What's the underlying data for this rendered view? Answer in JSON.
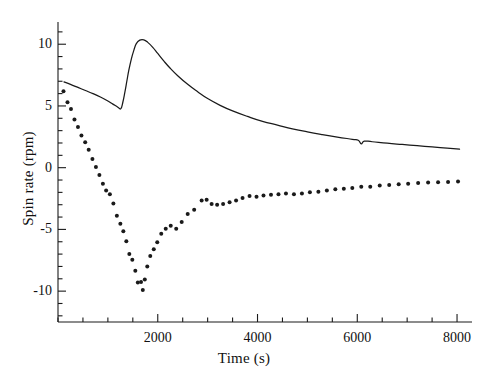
{
  "chart_data": {
    "type": "line",
    "title": "",
    "xlabel": "Time (s)",
    "ylabel": "Spin rate (rpm)",
    "xlim": [
      0,
      8300
    ],
    "ylim": [
      -12.5,
      11.8
    ],
    "grid": false,
    "legend": "none",
    "x_major_ticks": [
      2000,
      4000,
      6000,
      8000
    ],
    "x_major_tick_labels": [
      "2000",
      "4000",
      "6000",
      "8000"
    ],
    "x_minor_tick_step": 500,
    "y_major_ticks": [
      10,
      5,
      0,
      -5,
      -10
    ],
    "y_major_tick_labels": [
      "10",
      "5",
      "0",
      "-5",
      "-10"
    ],
    "y_minor_tick_step": 1,
    "axes_style": "left-bottom-spines",
    "line_color": "#1a1a1a",
    "marker_color": "#1a1a1a",
    "series": [
      {
        "name": "solid-curve",
        "style": "line",
        "points": [
          [
            120,
            6.95
          ],
          [
            250,
            6.75
          ],
          [
            400,
            6.5
          ],
          [
            550,
            6.25
          ],
          [
            700,
            6.0
          ],
          [
            850,
            5.72
          ],
          [
            1000,
            5.4
          ],
          [
            1100,
            5.15
          ],
          [
            1200,
            4.9
          ],
          [
            1260,
            4.78
          ],
          [
            1300,
            5.3
          ],
          [
            1340,
            6.1
          ],
          [
            1380,
            7.0
          ],
          [
            1420,
            7.9
          ],
          [
            1470,
            8.8
          ],
          [
            1520,
            9.5
          ],
          [
            1570,
            10.05
          ],
          [
            1640,
            10.33
          ],
          [
            1720,
            10.35
          ],
          [
            1800,
            10.15
          ],
          [
            1900,
            9.75
          ],
          [
            2000,
            9.25
          ],
          [
            2120,
            8.65
          ],
          [
            2250,
            8.05
          ],
          [
            2400,
            7.45
          ],
          [
            2600,
            6.75
          ],
          [
            2800,
            6.15
          ],
          [
            3000,
            5.6
          ],
          [
            3250,
            5.05
          ],
          [
            3500,
            4.6
          ],
          [
            3800,
            4.15
          ],
          [
            4100,
            3.75
          ],
          [
            4400,
            3.45
          ],
          [
            4700,
            3.15
          ],
          [
            5000,
            2.9
          ],
          [
            5300,
            2.68
          ],
          [
            5600,
            2.48
          ],
          [
            5900,
            2.3
          ],
          [
            6020,
            2.22
          ],
          [
            6080,
            1.92
          ],
          [
            6140,
            2.15
          ],
          [
            6300,
            2.1
          ],
          [
            6600,
            1.98
          ],
          [
            6900,
            1.88
          ],
          [
            7200,
            1.78
          ],
          [
            7500,
            1.68
          ],
          [
            7800,
            1.58
          ],
          [
            8050,
            1.5
          ]
        ]
      },
      {
        "name": "dotted-series",
        "style": "markers",
        "points": [
          [
            110,
            6.2
          ],
          [
            190,
            5.3
          ],
          [
            260,
            4.75
          ],
          [
            330,
            3.9
          ],
          [
            400,
            3.3
          ],
          [
            470,
            2.6
          ],
          [
            545,
            2.05
          ],
          [
            615,
            1.45
          ],
          [
            690,
            0.7
          ],
          [
            760,
            0.05
          ],
          [
            830,
            -0.6
          ],
          [
            900,
            -1.3
          ],
          [
            965,
            -1.85
          ],
          [
            1040,
            -2.15
          ],
          [
            1110,
            -2.9
          ],
          [
            1180,
            -3.9
          ],
          [
            1250,
            -4.55
          ],
          [
            1310,
            -5.15
          ],
          [
            1370,
            -5.95
          ],
          [
            1430,
            -7.0
          ],
          [
            1490,
            -7.45
          ],
          [
            1550,
            -8.35
          ],
          [
            1600,
            -9.3
          ],
          [
            1665,
            -9.25
          ],
          [
            1700,
            -9.9
          ],
          [
            1740,
            -9.05
          ],
          [
            1790,
            -8.0
          ],
          [
            1850,
            -7.15
          ],
          [
            1920,
            -6.6
          ],
          [
            1990,
            -6.05
          ],
          [
            2070,
            -5.35
          ],
          [
            2160,
            -4.95
          ],
          [
            2260,
            -4.7
          ],
          [
            2370,
            -4.95
          ],
          [
            2480,
            -4.4
          ],
          [
            2600,
            -3.75
          ],
          [
            2730,
            -3.4
          ],
          [
            2880,
            -2.65
          ],
          [
            2980,
            -2.6
          ],
          [
            3080,
            -2.95
          ],
          [
            3190,
            -3.0
          ],
          [
            3310,
            -2.95
          ],
          [
            3440,
            -2.8
          ],
          [
            3570,
            -2.65
          ],
          [
            3700,
            -2.45
          ],
          [
            3840,
            -2.3
          ],
          [
            3980,
            -2.35
          ],
          [
            4120,
            -2.25
          ],
          [
            4270,
            -2.2
          ],
          [
            4420,
            -2.15
          ],
          [
            4570,
            -2.1
          ],
          [
            4730,
            -2.15
          ],
          [
            4890,
            -2.1
          ],
          [
            5050,
            -2.0
          ],
          [
            5220,
            -1.95
          ],
          [
            5390,
            -1.85
          ],
          [
            5560,
            -1.75
          ],
          [
            5730,
            -1.7
          ],
          [
            5900,
            -1.65
          ],
          [
            6080,
            -1.55
          ],
          [
            6260,
            -1.55
          ],
          [
            6450,
            -1.45
          ],
          [
            6640,
            -1.4
          ],
          [
            6830,
            -1.35
          ],
          [
            7020,
            -1.3
          ],
          [
            7220,
            -1.25
          ],
          [
            7420,
            -1.2
          ],
          [
            7620,
            -1.18
          ],
          [
            7820,
            -1.15
          ],
          [
            8020,
            -1.12
          ]
        ]
      }
    ]
  }
}
